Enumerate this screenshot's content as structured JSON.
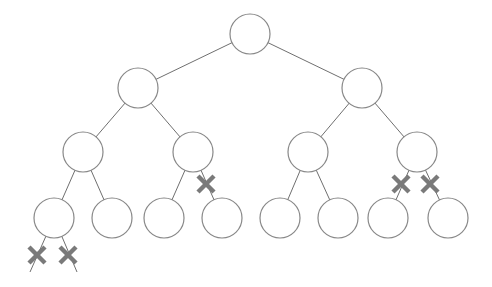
{
  "diagram": {
    "type": "binary-tree",
    "colors": {
      "edge": "#6f6f6f",
      "node_stroke": "#888888",
      "node_fill": "#ffffff",
      "cross": "#7a7a7a",
      "background": "#ffffff"
    },
    "node_radius": 20,
    "nodes": [
      {
        "id": "n0",
        "level": 0,
        "x": 250,
        "y": 34
      },
      {
        "id": "n1",
        "level": 1,
        "x": 138,
        "y": 88
      },
      {
        "id": "n2",
        "level": 1,
        "x": 362,
        "y": 88
      },
      {
        "id": "n3",
        "level": 2,
        "x": 83,
        "y": 152
      },
      {
        "id": "n4",
        "level": 2,
        "x": 193,
        "y": 152
      },
      {
        "id": "n5",
        "level": 2,
        "x": 308,
        "y": 152
      },
      {
        "id": "n6",
        "level": 2,
        "x": 417,
        "y": 152
      },
      {
        "id": "n7",
        "level": 3,
        "x": 54,
        "y": 218
      },
      {
        "id": "n8",
        "level": 3,
        "x": 112,
        "y": 218
      },
      {
        "id": "n9",
        "level": 3,
        "x": 164,
        "y": 218
      },
      {
        "id": "n10",
        "level": 3,
        "x": 222,
        "y": 218
      },
      {
        "id": "n11",
        "level": 3,
        "x": 280,
        "y": 218
      },
      {
        "id": "n12",
        "level": 3,
        "x": 338,
        "y": 218
      },
      {
        "id": "n13",
        "level": 3,
        "x": 388,
        "y": 218
      },
      {
        "id": "n14",
        "level": 3,
        "x": 448,
        "y": 218
      }
    ],
    "edges": [
      {
        "from": "n0",
        "to": "n1",
        "cut": false
      },
      {
        "from": "n0",
        "to": "n2",
        "cut": false
      },
      {
        "from": "n1",
        "to": "n3",
        "cut": false
      },
      {
        "from": "n1",
        "to": "n4",
        "cut": false
      },
      {
        "from": "n2",
        "to": "n5",
        "cut": false
      },
      {
        "from": "n2",
        "to": "n6",
        "cut": false
      },
      {
        "from": "n3",
        "to": "n7",
        "cut": false
      },
      {
        "from": "n3",
        "to": "n8",
        "cut": false
      },
      {
        "from": "n4",
        "to": "n9",
        "cut": false
      },
      {
        "from": "n4",
        "to": "n10",
        "cut": true
      },
      {
        "from": "n5",
        "to": "n11",
        "cut": false
      },
      {
        "from": "n5",
        "to": "n12",
        "cut": false
      },
      {
        "from": "n6",
        "to": "n13",
        "cut": true
      },
      {
        "from": "n6",
        "to": "n14",
        "cut": true
      }
    ],
    "dangling_edges": [
      {
        "from": "n7",
        "x2": 30,
        "y2": 272,
        "cut": true
      },
      {
        "from": "n7",
        "x2": 77,
        "y2": 272,
        "cut": true
      }
    ],
    "cross_marks": [
      {
        "x": 37,
        "y": 255
      },
      {
        "x": 68,
        "y": 255
      },
      {
        "x": 206,
        "y": 184
      },
      {
        "x": 401,
        "y": 184
      },
      {
        "x": 430,
        "y": 184
      }
    ]
  }
}
